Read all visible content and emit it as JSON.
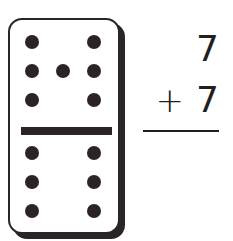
{
  "domino": {
    "top_half": {
      "pips": 7
    },
    "bottom_half": {
      "pips": 6
    },
    "top_pip_positions": [
      [
        22,
        22
      ],
      [
        84,
        22
      ],
      [
        22,
        51
      ],
      [
        53,
        51
      ],
      [
        84,
        51
      ],
      [
        22,
        80
      ],
      [
        84,
        80
      ]
    ],
    "bottom_pip_positions": [
      [
        22,
        133
      ],
      [
        84,
        133
      ],
      [
        22,
        162
      ],
      [
        84,
        162
      ],
      [
        22,
        191
      ],
      [
        84,
        191
      ]
    ]
  },
  "problem": {
    "addend1": "7",
    "operator": "+",
    "addend2": "7"
  }
}
